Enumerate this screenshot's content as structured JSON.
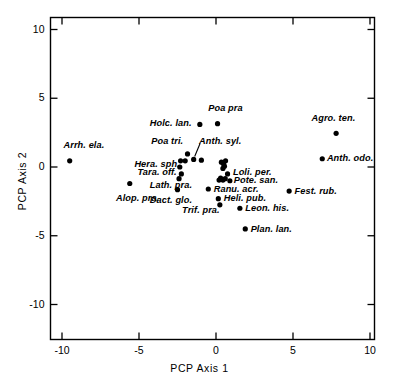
{
  "chart_data": {
    "type": "scatter",
    "title": "",
    "xlabel": "PCP Axis 1",
    "ylabel": "PCP Axis 2",
    "xlim": [
      -11.3,
      11.3
    ],
    "ylim": [
      -11.5,
      11.0
    ],
    "xticks": [
      -10,
      -5,
      0,
      5,
      10
    ],
    "xticklabels": [
      "-10",
      "-5",
      "0",
      "5",
      "10"
    ],
    "yticks": [
      -10,
      -5,
      0,
      5,
      10
    ],
    "yticklabels": [
      "-10",
      "-5",
      "0",
      "5",
      "10"
    ],
    "grid": false,
    "legend": null,
    "marker": "filled-circle",
    "marker_color": "#000000",
    "points": [
      {
        "label": "Arrh. ela.",
        "x": -9.5,
        "y": 0.45,
        "lx": -9.9,
        "ly": 1.55,
        "anchor": "start",
        "leader": false
      },
      {
        "label": "Holc. lan.",
        "x": -1.05,
        "y": 3.1,
        "lx": -4.3,
        "ly": 3.1,
        "anchor": "start",
        "leader": false
      },
      {
        "label": "Poa pra",
        "x": 0.1,
        "y": 3.15,
        "lx": -0.5,
        "ly": 4.2,
        "anchor": "start",
        "leader": false
      },
      {
        "label": "Agro. ten.",
        "x": 7.8,
        "y": 2.45,
        "lx": 6.2,
        "ly": 3.5,
        "anchor": "start",
        "leader": false
      },
      {
        "label": "Poa tri.",
        "x": -1.85,
        "y": 0.95,
        "lx": -4.2,
        "ly": 1.85,
        "anchor": "start",
        "leader": false
      },
      {
        "label": "Anth. syl.",
        "x": -1.45,
        "y": 0.55,
        "lx": -1.1,
        "ly": 1.85,
        "anchor": "start",
        "leader": true
      },
      {
        "label": "Anth. odo.",
        "x": 6.9,
        "y": 0.6,
        "lx": 7.2,
        "ly": 0.6,
        "anchor": "start",
        "leader": false
      },
      {
        "label": "Hera. sph.",
        "x": -2.3,
        "y": 0.45,
        "lx": -5.3,
        "ly": 0.15,
        "anchor": "start",
        "leader": false
      },
      {
        "label": "Tara. off.",
        "x": -2.35,
        "y": 0.0,
        "lx": -5.1,
        "ly": -0.4,
        "anchor": "start",
        "leader": false
      },
      {
        "label": "Loli. per.",
        "x": 0.75,
        "y": -0.5,
        "lx": 1.1,
        "ly": -0.45,
        "anchor": "start",
        "leader": false
      },
      {
        "label": "Pote. san.",
        "x": 0.9,
        "y": -1.0,
        "lx": 1.15,
        "ly": -1.05,
        "anchor": "start",
        "leader": false
      },
      {
        "label": "Lath. pra.",
        "x": -2.4,
        "y": -0.85,
        "lx": -4.3,
        "ly": -1.35,
        "anchor": "start",
        "leader": false
      },
      {
        "label": "Alop. pra.",
        "x": -5.6,
        "y": -1.2,
        "lx": -6.5,
        "ly": -2.3,
        "anchor": "start",
        "leader": false
      },
      {
        "label": "Fest. rub.",
        "x": 4.75,
        "y": -1.75,
        "lx": 5.1,
        "ly": -1.8,
        "anchor": "start",
        "leader": false
      },
      {
        "label": "Ranu. acr.",
        "x": -0.5,
        "y": -1.6,
        "lx": -0.15,
        "ly": -1.65,
        "anchor": "start",
        "leader": false
      },
      {
        "label": "Dact. glo.",
        "x": -2.5,
        "y": -1.65,
        "lx": -4.3,
        "ly": -2.5,
        "anchor": "start",
        "leader": false
      },
      {
        "label": "Heli. pub.",
        "x": 0.15,
        "y": -2.3,
        "lx": 0.5,
        "ly": -2.35,
        "anchor": "start",
        "leader": false
      },
      {
        "label": "Trif. pra.",
        "x": 0.25,
        "y": -2.75,
        "lx": -2.2,
        "ly": -3.2,
        "anchor": "start",
        "leader": false
      },
      {
        "label": "Leon. his.",
        "x": 1.55,
        "y": -3.0,
        "lx": 1.9,
        "ly": -3.05,
        "anchor": "start",
        "leader": false
      },
      {
        "label": "Plan. lan.",
        "x": 1.9,
        "y": -4.5,
        "lx": 2.25,
        "ly": -4.55,
        "anchor": "start",
        "leader": false
      }
    ],
    "extra_points": [
      {
        "x": -0.95,
        "y": 0.5
      },
      {
        "x": -2.0,
        "y": 0.45
      },
      {
        "x": -2.25,
        "y": -0.5
      },
      {
        "x": 0.35,
        "y": 0.35
      },
      {
        "x": 0.5,
        "y": 0.2
      },
      {
        "x": 0.55,
        "y": 0.05
      },
      {
        "x": 0.45,
        "y": -0.1
      },
      {
        "x": 0.62,
        "y": 0.45
      },
      {
        "x": 0.3,
        "y": -0.8
      },
      {
        "x": 0.45,
        "y": -0.95
      },
      {
        "x": 0.6,
        "y": -0.85
      },
      {
        "x": 0.2,
        "y": -0.95
      }
    ]
  },
  "axes": {
    "x_title": "PCP Axis 1",
    "y_title": "PCP Axis 2"
  }
}
